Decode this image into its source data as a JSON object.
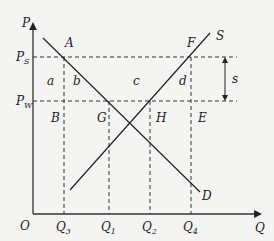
{
  "diagram": {
    "type": "supply-demand-subsidy",
    "axes": {
      "y_label": "P",
      "x_label": "Q",
      "origin_label": "O"
    },
    "price_labels": {
      "ps": {
        "main": "P",
        "sub": "S"
      },
      "pw": {
        "main": "P",
        "sub": "W"
      }
    },
    "quantity_labels": {
      "q3": {
        "main": "Q",
        "sub": "3"
      },
      "q1": {
        "main": "Q",
        "sub": "1"
      },
      "q2": {
        "main": "Q",
        "sub": "2"
      },
      "q4": {
        "main": "Q",
        "sub": "4"
      }
    },
    "curves": {
      "demand": "D",
      "supply": "S"
    },
    "points": {
      "A": "A",
      "F": "F",
      "B": "B",
      "G": "G",
      "H": "H",
      "E": "E"
    },
    "areas": {
      "a": "a",
      "b": "b",
      "c": "c",
      "d": "d"
    },
    "subsidy_label": "s"
  }
}
